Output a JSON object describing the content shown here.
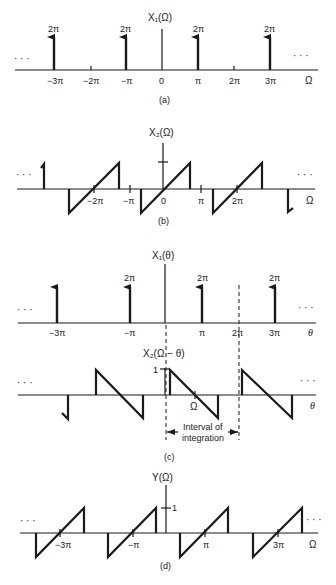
{
  "panels": {
    "a": {
      "caption": "(a)",
      "title": "X₁(Ω)",
      "axis_label": "Ω",
      "ellipsis": "· · ·",
      "ticks": [
        "−3π",
        "−2π",
        "−π",
        "0",
        "π",
        "2π",
        "3π"
      ],
      "impulse_label": "2π"
    },
    "b": {
      "caption": "(b)",
      "title": "X₂(Ω)",
      "axis_label": "Ω",
      "ellipsis": "· · ·",
      "ticks": [
        "−2π",
        "−π",
        "0",
        "π",
        "2π"
      ]
    },
    "c": {
      "caption": "(c)",
      "title_top": "X₁(θ)",
      "axis_label": "θ",
      "ellipsis": "· · ·",
      "ticks": [
        "−3π",
        "−π",
        "π",
        "2π",
        "3π"
      ],
      "impulse_label": "2π",
      "title_bottom": "X₂(Ω − θ)",
      "unit_tick": "1",
      "omega_mark": "Ω",
      "interval_label_1": "Interval of",
      "interval_label_2": "integration"
    },
    "d": {
      "caption": "(d)",
      "title": "Y(Ω)",
      "axis_label": "Ω",
      "ellipsis": "· · ·",
      "unit_tick": "1",
      "ticks": [
        "−3π",
        "−π",
        "π",
        "3π"
      ]
    }
  }
}
